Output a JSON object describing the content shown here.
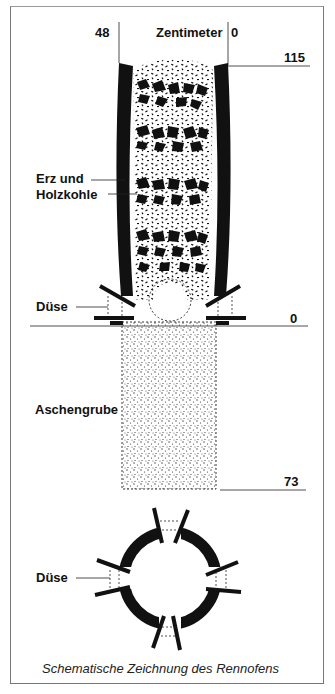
{
  "diagram": {
    "title": "Schematische Zeichnung des Rennofens",
    "scale": {
      "unit_label": "Zentimeter",
      "width_left": "48",
      "width_right": "0",
      "height_top": "115",
      "height_zero": "0",
      "depth_bottom": "73"
    },
    "labels": {
      "charge_line1": "Erz und",
      "charge_line2": "Holzkohle",
      "tuyere_side": "Düse",
      "ash_pit": "Aschengrube",
      "tuyere_plan": "Düse"
    },
    "colors": {
      "ink": "#111111",
      "frame": "#777777",
      "background": "#ffffff"
    }
  }
}
